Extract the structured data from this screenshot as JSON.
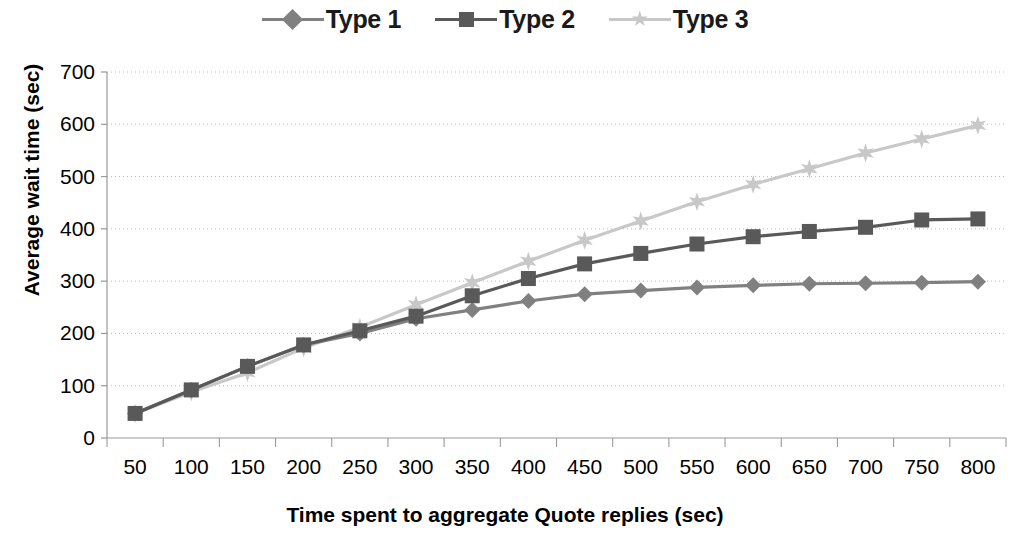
{
  "chart_data": {
    "type": "line",
    "title": "",
    "xlabel": "Time spent to aggregate Quote replies (sec)",
    "ylabel": "Average wait time (sec)",
    "x": [
      50,
      100,
      150,
      200,
      250,
      300,
      350,
      400,
      450,
      500,
      550,
      600,
      650,
      700,
      750,
      800
    ],
    "categories": [
      "50",
      "100",
      "150",
      "200",
      "250",
      "300",
      "350",
      "400",
      "450",
      "500",
      "550",
      "600",
      "650",
      "700",
      "750",
      "800"
    ],
    "xtick_labels": [
      "50",
      "100",
      "150",
      "200",
      "250",
      "300",
      "350",
      "400",
      "450",
      "500",
      "550",
      "600",
      "650",
      "700",
      "750",
      "800"
    ],
    "ytick_labels": [
      "0",
      "100",
      "200",
      "300",
      "400",
      "500",
      "600",
      "700"
    ],
    "yticks": [
      0,
      100,
      200,
      300,
      400,
      500,
      600,
      700
    ],
    "ylim": [
      0,
      700
    ],
    "grid": true,
    "grid_axis": "y",
    "legend_position": "top-center",
    "series": [
      {
        "name": "Type 1",
        "marker": "diamond",
        "color": "#808080",
        "values": [
          47,
          92,
          137,
          178,
          200,
          228,
          245,
          262,
          275,
          282,
          288,
          292,
          295,
          296,
          297,
          299
        ]
      },
      {
        "name": "Type 2",
        "marker": "square",
        "color": "#595959",
        "values": [
          47,
          92,
          137,
          178,
          205,
          233,
          272,
          305,
          333,
          353,
          371,
          385,
          395,
          403,
          417,
          419
        ]
      },
      {
        "name": "Type 3",
        "marker": "star",
        "color": "#c8c8c8",
        "values": [
          47,
          88,
          125,
          172,
          212,
          255,
          297,
          338,
          378,
          415,
          452,
          485,
          515,
          545,
          572,
          598
        ]
      }
    ]
  },
  "legend": {
    "items": [
      {
        "label": "Type 1"
      },
      {
        "label": "Type 2"
      },
      {
        "label": "Type 3"
      }
    ]
  },
  "axes": {
    "x_title": "Time spent to aggregate Quote replies (sec)",
    "y_title": "Average wait time (sec)"
  },
  "colors": {
    "type1": "#808080",
    "type2": "#595959",
    "type3": "#c8c8c8",
    "grid": "#bbbbbb",
    "axis": "#999999",
    "text": "#000000"
  }
}
